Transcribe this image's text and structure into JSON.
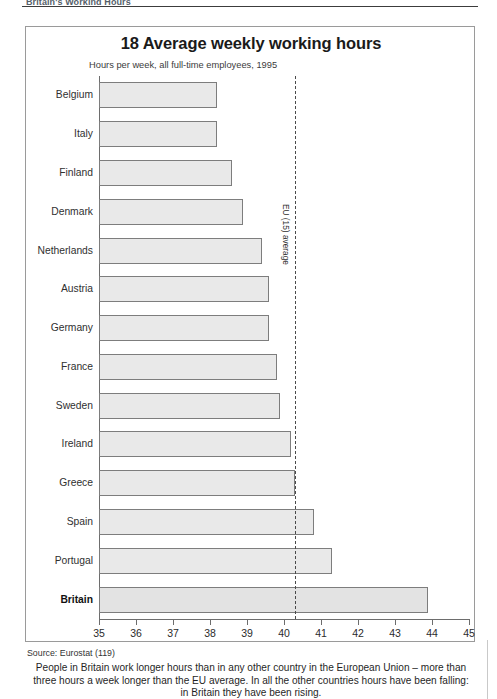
{
  "runhead": {
    "text": "Britain's Working Hours"
  },
  "figure": {
    "title": "18 Average weekly working hours",
    "subtitle": "Hours per week, all full-time employees, 1995",
    "average_label": "EU (15) average",
    "source": "Source: Eurostat (119)",
    "caption": "People in Britain work longer hours than in any other country in the European Union – more than three hours a week longer than the EU average. In all the other countries hours have been falling: in Britain they have been rising."
  },
  "chart_data": {
    "type": "bar",
    "orientation": "horizontal",
    "title": "18 Average weekly working hours",
    "subtitle": "Hours per week, all full-time employees, 1995",
    "xlabel": "",
    "ylabel": "",
    "xlim": [
      35,
      45
    ],
    "xticks": [
      35,
      36,
      37,
      38,
      39,
      40,
      41,
      42,
      43,
      44,
      45
    ],
    "grid": false,
    "legend": false,
    "categories": [
      "Belgium",
      "Italy",
      "Finland",
      "Denmark",
      "Netherlands",
      "Austria",
      "Germany",
      "France",
      "Sweden",
      "Ireland",
      "Greece",
      "Spain",
      "Portugal",
      "Britain"
    ],
    "values": [
      38.2,
      38.2,
      38.6,
      38.9,
      39.4,
      39.6,
      39.6,
      39.8,
      39.9,
      40.2,
      40.3,
      40.8,
      41.3,
      43.9
    ],
    "reference_line": {
      "label": "EU (15) average",
      "value": 40.3
    },
    "highlight": "Britain",
    "bar_fill": "#e9e9e9",
    "bar_stroke": "#7d7d7d"
  }
}
